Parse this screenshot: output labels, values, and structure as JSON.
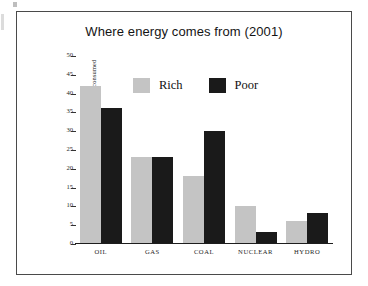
{
  "chart_data": {
    "type": "bar",
    "title": "Where energy comes from (2001)",
    "xlabel": "",
    "ylabel": "% of total energy consumed",
    "categories": [
      "OIL",
      "GAS",
      "COAL",
      "NUCLEAR",
      "HYDRO"
    ],
    "series": [
      {
        "name": "Rich",
        "color": "#c4c4c4",
        "values": [
          42,
          23,
          18,
          10,
          6
        ]
      },
      {
        "name": "Poor",
        "color": "#1a1a1a",
        "values": [
          36,
          23,
          30,
          3,
          8
        ]
      }
    ],
    "ylim": [
      0,
      50
    ],
    "ytick_step": 5,
    "yticks": [
      50,
      45,
      40,
      35,
      30,
      25,
      20,
      15,
      10,
      5,
      0
    ],
    "ytick_labels": [
      "50",
      "45",
      "40",
      "35",
      "30",
      "25",
      "20",
      "15",
      "10",
      "5",
      "0"
    ],
    "grid": false,
    "legend_position": "inside-top-center",
    "legend_entries": [
      "Rich",
      "Poor"
    ]
  },
  "figure": {
    "frame_color": "#4a4a4a",
    "background": "#ffffff"
  }
}
